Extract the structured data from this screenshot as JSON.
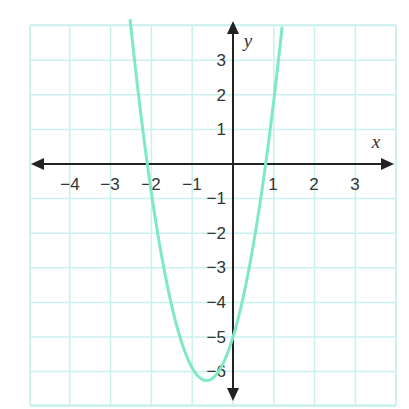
{
  "chart_data": {
    "type": "line",
    "title": "",
    "xlabel": "x",
    "ylabel": "y",
    "xlim": [
      -5,
      4
    ],
    "ylim": [
      -7,
      4
    ],
    "grid": true,
    "x_ticks": [
      -4,
      -3,
      -2,
      -1,
      1,
      2,
      3
    ],
    "y_ticks": [
      3,
      2,
      1,
      -1,
      -2,
      -3,
      -4,
      -5,
      -6
    ],
    "x_tick_labels": [
      "−4",
      "−3",
      "−2",
      "−1",
      "1",
      "2",
      "3"
    ],
    "y_tick_labels": [
      "3",
      "2",
      "1",
      "−1",
      "−2",
      "−3",
      "−4",
      "−5",
      "−6"
    ],
    "series": [
      {
        "name": "parabola",
        "equation_approx": "y = 3x^2 + 3.9x - 5",
        "color": "#7fe8c4",
        "key_points": [
          {
            "x": -2.52,
            "y": 4.0,
            "note": "exits top of grid"
          },
          {
            "x": -2.1,
            "y": 0,
            "note": "x-intercept"
          },
          {
            "x": -0.65,
            "y": -6.27,
            "note": "vertex (minimum)"
          },
          {
            "x": 0,
            "y": -5,
            "note": "y-intercept"
          },
          {
            "x": 0.8,
            "y": 0,
            "note": "x-intercept"
          },
          {
            "x": 1.2,
            "y": 4.0,
            "note": "exits top of grid"
          }
        ]
      }
    ],
    "colors": {
      "grid": "#c9f1ee",
      "axis": "#222222",
      "curve": "#7fe8c4"
    }
  },
  "labels": {
    "x_axis": "x",
    "y_axis": "y",
    "x_ticks": [
      "−4",
      "−3",
      "−2",
      "−1",
      "1",
      "2",
      "3"
    ],
    "y_ticks": [
      "3",
      "2",
      "1",
      "−1",
      "−2",
      "−3",
      "−4",
      "−5",
      "−6"
    ]
  }
}
